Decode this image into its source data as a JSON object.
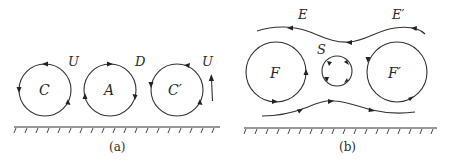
{
  "figure": {
    "panels": [
      {
        "id": "a",
        "caption": "(a)",
        "vortices": [
          {
            "label": "C",
            "cx": 45,
            "cy": 90,
            "r": 26,
            "rotation": "counter-clockwise"
          },
          {
            "label": "A",
            "cx": 110,
            "cy": 90,
            "r": 26,
            "rotation": "clockwise"
          },
          {
            "label": "C′",
            "cx": 177,
            "cy": 90,
            "r": 26,
            "rotation": "counter-clockwise"
          }
        ],
        "flow_labels": [
          {
            "text": "U",
            "x": 72,
            "y": 66
          },
          {
            "text": "D",
            "x": 138,
            "y": 66
          },
          {
            "text": "U",
            "x": 206,
            "y": 66
          }
        ],
        "up_arrow": {
          "x": 212,
          "y_from": 101,
          "y_to": 76
        },
        "wall": {
          "y": 127,
          "x_from": 14,
          "x_to": 220
        }
      },
      {
        "id": "b",
        "caption": "(b)",
        "vortices": [
          {
            "label": "F",
            "cx": 276,
            "cy": 72,
            "r": 30,
            "rotation": "counter-clockwise"
          },
          {
            "label": "S",
            "cx": 337,
            "cy": 71,
            "r": 15,
            "rotation": "clockwise"
          },
          {
            "label": "F′",
            "cx": 397,
            "cy": 72,
            "r": 30,
            "rotation": "counter-clockwise"
          }
        ],
        "streamline_labels": [
          {
            "text": "E",
            "x": 300,
            "y": 19
          },
          {
            "text": "E′",
            "x": 396,
            "y": 19
          }
        ],
        "streamlines": [
          {
            "name": "upper",
            "direction": "right-to-left"
          },
          {
            "name": "lower",
            "direction": "left-to-right"
          }
        ],
        "wall": {
          "y": 128,
          "x_from": 244,
          "x_to": 437
        }
      }
    ],
    "labels": {
      "a_C": "C",
      "a_A": "A",
      "a_Cp": "C′",
      "a_U1": "U",
      "a_D": "D",
      "a_U2": "U",
      "b_E": "E",
      "b_Ep": "E′",
      "b_S": "S",
      "b_F": "F",
      "b_Fp": "F′",
      "caption_a": "(a)",
      "caption_b": "(b)"
    },
    "colors": {
      "line": "#333333",
      "text": "#2a2a2a",
      "background": "#ffffff"
    }
  }
}
